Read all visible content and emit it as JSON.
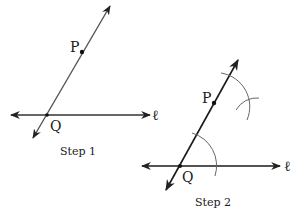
{
  "step1": {
    "caption": "Step 1",
    "point_p": "P",
    "point_q": "Q",
    "line_label": "ℓ"
  },
  "step2": {
    "caption": "Step 2",
    "point_p": "P",
    "point_q": "Q",
    "line_label": "ℓ"
  },
  "colors": {
    "step1_lines": "#4a4a4a",
    "step2_lines": "#1a1a1a",
    "arcs": "#555555"
  }
}
